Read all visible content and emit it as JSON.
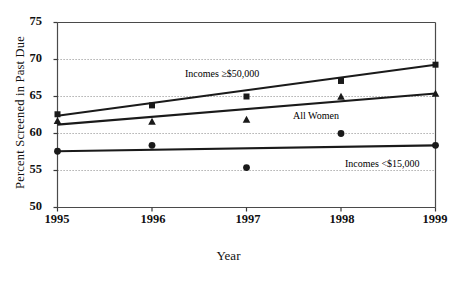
{
  "chart_data": {
    "type": "line",
    "title": "",
    "xlabel": "Year",
    "ylabel": "Percent Screened in Past Due",
    "x": [
      1995,
      1996,
      1997,
      1998,
      1999
    ],
    "xticklabels": [
      "1995",
      "1996",
      "1997",
      "1998",
      "1999"
    ],
    "xlim": [
      1995,
      1999
    ],
    "ylim": [
      50,
      75
    ],
    "yticks": [
      50,
      55,
      60,
      65,
      70,
      75
    ],
    "yticklabels": [
      "50",
      "55",
      "60",
      "65",
      "70",
      "75"
    ],
    "grid": "horizontal-dotted",
    "legend": "inline-annotations",
    "series": [
      {
        "name": "Incomes ≥$50,000",
        "marker": "square",
        "values": [
          62.6,
          63.8,
          65.0,
          67.1,
          69.3
        ],
        "trend_start": 62.4,
        "trend_end": 69.3,
        "color": "#1a1a1a"
      },
      {
        "name": "All Women",
        "marker": "triangle",
        "values": [
          61.7,
          61.6,
          61.9,
          65.0,
          65.4
        ],
        "trend_start": 61.2,
        "trend_end": 65.4,
        "color": "#1a1a1a"
      },
      {
        "name": "Incomes <$15,000",
        "marker": "circle",
        "values": [
          57.6,
          58.4,
          55.4,
          60.0,
          58.4
        ],
        "trend_start": 57.6,
        "trend_end": 58.4,
        "color": "#1a1a1a"
      }
    ],
    "annotations": [
      {
        "text": "Incomes ≥$50,000",
        "x": 185,
        "y": 68
      },
      {
        "text": "All Women",
        "x": 293,
        "y": 110
      },
      {
        "text": "Incomes <$15,000",
        "x": 345,
        "y": 158
      }
    ]
  },
  "caption": ""
}
